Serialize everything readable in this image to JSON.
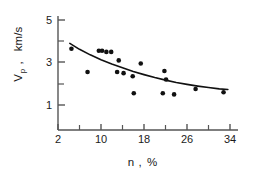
{
  "chart_data": {
    "type": "scatter",
    "title": "",
    "subtitle": "",
    "xlabel": "n , %",
    "xlabel_symbol": "n",
    "xlabel_unit": "%",
    "ylabel": "V_p , km/s",
    "ylabel_symbol": "V",
    "ylabel_subscript": "p",
    "ylabel_unit": "km/s",
    "xlim": [
      2,
      34
    ],
    "ylim": [
      1,
      5
    ],
    "xticks": [
      2,
      10,
      18,
      26,
      34
    ],
    "xticklabels": [
      "2",
      "10",
      "18",
      "26",
      "34"
    ],
    "xminorticks": [
      6,
      14,
      22,
      30
    ],
    "yticks": [
      1,
      3,
      5
    ],
    "yticklabels": [
      "1",
      "3",
      "5"
    ],
    "yminorticks": [
      2,
      4
    ],
    "grid": false,
    "legend": false,
    "legend_position": "none",
    "marker": "filled-circle",
    "marker_color": "#111111",
    "line_color": "#111111",
    "axis_color": "#444444",
    "background": "#ffffff",
    "points": [
      {
        "x": 4.5,
        "y": 3.65
      },
      {
        "x": 7.5,
        "y": 2.55
      },
      {
        "x": 9.6,
        "y": 3.55
      },
      {
        "x": 10.2,
        "y": 3.55
      },
      {
        "x": 11.0,
        "y": 3.5
      },
      {
        "x": 11.9,
        "y": 3.5
      },
      {
        "x": 13.3,
        "y": 3.1
      },
      {
        "x": 13.0,
        "y": 2.55
      },
      {
        "x": 14.2,
        "y": 2.5
      },
      {
        "x": 15.9,
        "y": 2.35
      },
      {
        "x": 16.1,
        "y": 1.55
      },
      {
        "x": 17.4,
        "y": 2.95
      },
      {
        "x": 21.8,
        "y": 2.6
      },
      {
        "x": 22.1,
        "y": 2.2
      },
      {
        "x": 21.5,
        "y": 1.55
      },
      {
        "x": 23.6,
        "y": 1.5
      },
      {
        "x": 27.6,
        "y": 1.75
      },
      {
        "x": 32.8,
        "y": 1.6
      }
    ],
    "fit_curve": {
      "name": "fitted trend",
      "x": [
        4.2,
        6,
        8,
        10,
        12,
        14,
        16,
        18,
        20,
        22,
        24,
        26,
        28,
        30,
        32,
        33.6
      ],
      "y": [
        3.9,
        3.62,
        3.36,
        3.13,
        2.93,
        2.75,
        2.58,
        2.43,
        2.29,
        2.17,
        2.06,
        1.97,
        1.89,
        1.82,
        1.76,
        1.73
      ]
    }
  }
}
